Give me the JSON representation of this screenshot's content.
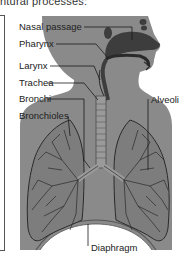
{
  "caption": "ntural processes:",
  "diagram": {
    "labels": {
      "nasal_passage": "Nasal passage",
      "pharynx": "Pharynx",
      "larynx": "Larynx",
      "trachea": "Trachea",
      "bronchi": "Bronchi",
      "bronchioles": "Bronchioles",
      "alveoli": "Alveoli",
      "diaphragm": "Diaphragm"
    },
    "colors": {
      "body": "#8a8a8a",
      "dark": "#4a4a4a",
      "lung": "#7d7d7d",
      "line": "#1a1a1a"
    }
  }
}
